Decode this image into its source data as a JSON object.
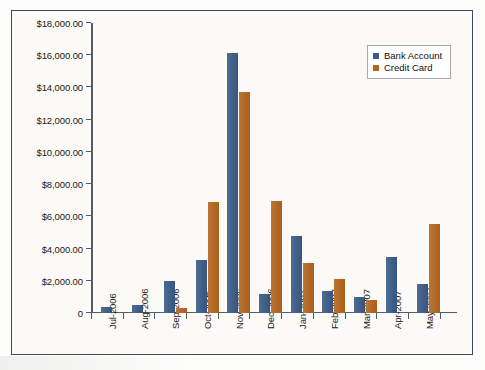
{
  "legend": {
    "position": "top-right",
    "items": [
      {
        "label": "Bank Account",
        "color": "#3a5a87",
        "swatch": "legend-swatch-bank"
      },
      {
        "label": "Credit Card",
        "color": "#b5651d",
        "swatch": "legend-swatch-credit"
      }
    ]
  },
  "axes": {
    "y_tick_labels": [
      "$18,000.00",
      "$16,000.00",
      "$14,000.00",
      "$12,000.00",
      "$10,000.00",
      "$8,000.00",
      "$6,000.00",
      "$4,000.00",
      "$2,000.00",
      "0"
    ],
    "x_tick_labels": [
      "Jul-2006",
      "Aug-2006",
      "Sep-2006",
      "Oct-2006",
      "Nov-2006",
      "Dec-2006",
      "Jan-2007",
      "Feb-2007",
      "Mar-2007",
      "Apr-2007",
      "May-2007"
    ]
  },
  "colors": {
    "bank_account": "#3a5a87",
    "credit_card": "#b5651d",
    "frame_border": "#3f4a63",
    "plot_background": "#fbfaf6",
    "axis": "#555c68"
  },
  "chart_data": {
    "type": "bar",
    "title": "",
    "subtitle": "",
    "xlabel": "",
    "ylabel": "",
    "ylim": [
      0,
      18000
    ],
    "ytick_values": [
      0,
      2000,
      4000,
      6000,
      8000,
      10000,
      12000,
      14000,
      16000,
      18000
    ],
    "ytick_format": "currency",
    "grid": false,
    "legend_position": "top-right",
    "categories": [
      "Jul-2006",
      "Aug-2006",
      "Sep-2006",
      "Oct-2006",
      "Nov-2006",
      "Dec-2006",
      "Jan-2007",
      "Feb-2007",
      "Mar-2007",
      "Apr-2007",
      "May-2007"
    ],
    "series": [
      {
        "name": "Bank Account",
        "color": "#3a5a87",
        "values": [
          400,
          500,
          2000,
          3300,
          16150,
          1200,
          4800,
          1350,
          1000,
          3500,
          1800
        ]
      },
      {
        "name": "Credit Card",
        "color": "#b5651d",
        "values": [
          0,
          0,
          300,
          6900,
          13700,
          6950,
          3100,
          2100,
          800,
          0,
          5500
        ]
      }
    ]
  }
}
